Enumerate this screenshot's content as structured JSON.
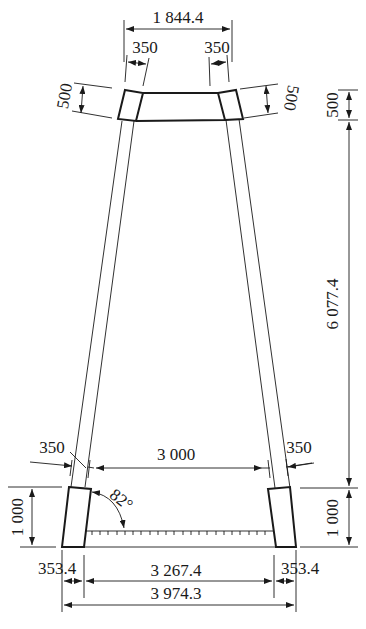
{
  "diagram": {
    "type": "frame-elevation-drawing",
    "colors": {
      "line": "#1a1a1a",
      "background": "#ffffff"
    },
    "dimensions": {
      "top_overall_width": "1 844.4",
      "top_left_leg_width": "350",
      "top_right_leg_width": "350",
      "top_left_cap_height": "500",
      "top_right_cap_height": "500",
      "right_top_segment": "500",
      "right_middle_segment": "6 077.4",
      "right_bottom_segment": "1 000",
      "left_bottom_height": "1 000",
      "mid_left_leg_width": "350",
      "mid_right_leg_width": "350",
      "mid_clear_span": "3 000",
      "angle": "82°",
      "bottom_left_width": "353.4",
      "bottom_clear_span": "3 267.4",
      "bottom_right_width": "353.4",
      "bottom_overall_width": "3 974.3"
    }
  }
}
